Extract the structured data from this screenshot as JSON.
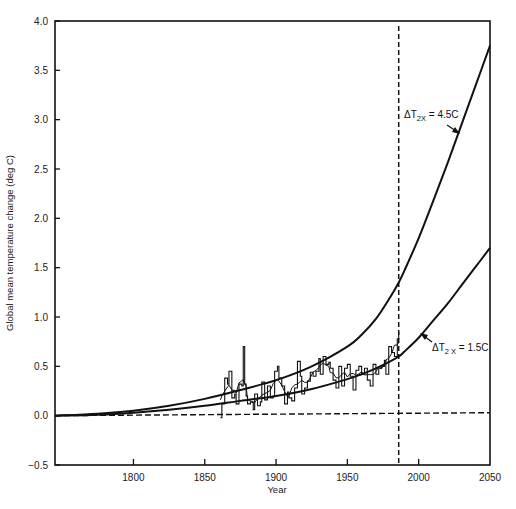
{
  "chart_data": {
    "type": "line",
    "title": "",
    "xlabel": "Year",
    "ylabel": "Global mean temperature change (deg C)",
    "xlim": [
      1745,
      2050
    ],
    "ylim": [
      -0.5,
      4.0
    ],
    "xticks": [
      1800,
      1850,
      1900,
      1950,
      2000,
      2050
    ],
    "xtick_labels": [
      "1800",
      "1850",
      "1900",
      "1950",
      "2000",
      "2050"
    ],
    "yticks": [
      -0.5,
      0.0,
      0.5,
      1.0,
      1.5,
      2.0,
      2.5,
      3.0,
      3.5,
      4.0
    ],
    "ytick_labels": [
      "−0.5",
      "0.0",
      "0.5",
      "1.0",
      "1.5",
      "2.0",
      "2.5",
      "3.0",
      "3.5",
      "4.0"
    ],
    "grid": false,
    "legend": null,
    "series": [
      {
        "name": "ΔT2x = 4.5C",
        "style": "solid",
        "x": [
          1745,
          1775,
          1800,
          1825,
          1850,
          1875,
          1900,
          1925,
          1950,
          1960,
          1970,
          1980,
          1986,
          1990,
          2000,
          2010,
          2020,
          2030,
          2040,
          2050
        ],
        "values": [
          0.0,
          0.02,
          0.05,
          0.1,
          0.17,
          0.26,
          0.36,
          0.5,
          0.7,
          0.82,
          0.98,
          1.2,
          1.35,
          1.47,
          1.8,
          2.17,
          2.55,
          2.95,
          3.35,
          3.75
        ]
      },
      {
        "name": "ΔT2x = 1.5C",
        "style": "solid",
        "x": [
          1745,
          1775,
          1800,
          1825,
          1850,
          1875,
          1900,
          1925,
          1950,
          1960,
          1970,
          1980,
          1986,
          1990,
          2000,
          2010,
          2020,
          2030,
          2040,
          2050
        ],
        "values": [
          0.0,
          0.01,
          0.03,
          0.06,
          0.1,
          0.15,
          0.2,
          0.27,
          0.37,
          0.42,
          0.48,
          0.55,
          0.6,
          0.65,
          0.79,
          0.96,
          1.13,
          1.32,
          1.51,
          1.7
        ]
      },
      {
        "name": "Observed",
        "style": "noisy",
        "x": [
          1861,
          1862,
          1864,
          1866,
          1867,
          1869,
          1871,
          1872,
          1874,
          1876,
          1877,
          1878,
          1879,
          1880,
          1882,
          1884,
          1885,
          1887,
          1889,
          1890,
          1892,
          1894,
          1896,
          1898,
          1899,
          1901,
          1902,
          1904,
          1906,
          1908,
          1909,
          1911,
          1913,
          1915,
          1917,
          1918,
          1920,
          1922,
          1924,
          1926,
          1928,
          1930,
          1931,
          1933,
          1935,
          1937,
          1938,
          1940,
          1942,
          1944,
          1946,
          1948,
          1950,
          1952,
          1954,
          1956,
          1958,
          1960,
          1962,
          1964,
          1966,
          1968,
          1970,
          1972,
          1974,
          1976,
          1977,
          1979,
          1981,
          1983,
          1985,
          1986
        ],
        "values": [
          -0.02,
          0.12,
          0.38,
          0.32,
          0.45,
          0.18,
          0.22,
          0.12,
          0.32,
          0.3,
          0.7,
          0.32,
          0.2,
          0.12,
          0.14,
          0.06,
          0.22,
          0.1,
          0.14,
          0.34,
          0.16,
          0.3,
          0.18,
          0.2,
          0.45,
          0.5,
          0.38,
          0.3,
          0.12,
          0.24,
          0.18,
          0.15,
          0.28,
          0.55,
          0.4,
          0.22,
          0.28,
          0.35,
          0.44,
          0.4,
          0.45,
          0.58,
          0.42,
          0.6,
          0.52,
          0.54,
          0.48,
          0.36,
          0.28,
          0.5,
          0.3,
          0.48,
          0.52,
          0.4,
          0.26,
          0.46,
          0.5,
          0.42,
          0.48,
          0.36,
          0.3,
          0.52,
          0.42,
          0.48,
          0.5,
          0.56,
          0.42,
          0.7,
          0.64,
          0.6,
          0.78,
          0.85
        ]
      },
      {
        "name": "Zero baseline",
        "style": "dashed-horizontal",
        "x": [
          1745,
          2050
        ],
        "values": [
          0.0,
          0.03
        ]
      }
    ],
    "annotations": [
      {
        "text": "ΔT2X = 4.5C",
        "main": "ΔT",
        "sub": "2X",
        "rest": " = 4.5C",
        "arrow_to": [
          2030,
          2.95
        ]
      },
      {
        "text": "ΔT2X = 1.5C",
        "main": "ΔT",
        "sub": "2 X",
        "rest": " = 1.5C",
        "arrow_to": [
          2005,
          0.87
        ]
      },
      {
        "text": "Vertical dashed line at present",
        "x": 1986,
        "style": "dashed-vertical"
      }
    ]
  },
  "labels": {
    "xlabel": "Year",
    "ylabel": "Global mean temperature change (deg C)",
    "annot_high_main": "ΔT",
    "annot_high_sub": "2X",
    "annot_high_rest": " = 4.5C",
    "annot_low_main": "ΔT",
    "annot_low_sub": "2 X",
    "annot_low_rest": " = 1.5C"
  }
}
